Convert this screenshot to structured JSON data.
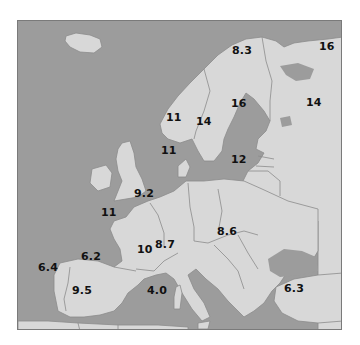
{
  "map": {
    "region": "Europe",
    "colors": {
      "sea": "#9c9c9c",
      "land": "#d8d8d8",
      "border": "#8c8c8c",
      "label": "#111111",
      "frame": "#7a7a7a"
    },
    "labels": [
      {
        "id": "norway-north",
        "value": "8.3",
        "x": 233,
        "y": 49
      },
      {
        "id": "russia-north",
        "value": "16",
        "x": 323,
        "y": 39
      },
      {
        "id": "norway",
        "value": "11",
        "x": 166,
        "y": 109
      },
      {
        "id": "sweden",
        "value": "14",
        "x": 195,
        "y": 113
      },
      {
        "id": "finland",
        "value": "16",
        "x": 230,
        "y": 96
      },
      {
        "id": "russia",
        "value": "14",
        "x": 305,
        "y": 95
      },
      {
        "id": "denmark",
        "value": "11",
        "x": 160,
        "y": 144
      },
      {
        "id": "lithuania",
        "value": "12",
        "x": 230,
        "y": 153
      },
      {
        "id": "benelux",
        "value": "9.2",
        "x": 133,
        "y": 186
      },
      {
        "id": "france-brittany",
        "value": "11",
        "x": 100,
        "y": 205
      },
      {
        "id": "spain-north",
        "value": "6.2",
        "x": 80,
        "y": 249
      },
      {
        "id": "france-south",
        "value": "10",
        "x": 136,
        "y": 242
      },
      {
        "id": "switzerland",
        "value": "8.7",
        "x": 154,
        "y": 237
      },
      {
        "id": "hungary",
        "value": "8.6",
        "x": 216,
        "y": 224
      },
      {
        "id": "portugal",
        "value": "6.4",
        "x": 37,
        "y": 260
      },
      {
        "id": "spain-south",
        "value": "9.5",
        "x": 71,
        "y": 283
      },
      {
        "id": "sardinia",
        "value": "4.0",
        "x": 146,
        "y": 283
      },
      {
        "id": "turkey",
        "value": "6.3",
        "x": 283,
        "y": 281
      }
    ]
  }
}
